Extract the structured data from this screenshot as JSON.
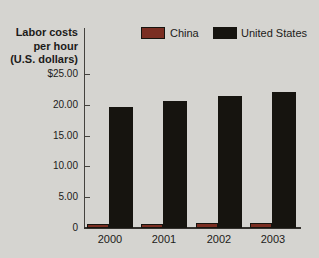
{
  "chart": {
    "y_axis_title_lines": [
      "Labor costs",
      "per hour",
      "(U.S. dollars)"
    ]
  },
  "chart_data": {
    "type": "bar",
    "title": "Labor costs per hour (U.S. dollars)",
    "xlabel": "",
    "ylabel": "Labor costs per hour (U.S. dollars)",
    "categories": [
      "2000",
      "2001",
      "2002",
      "2003"
    ],
    "series": [
      {
        "name": "China",
        "color": "#7a2e22",
        "values": [
          0.6,
          0.7,
          0.75,
          0.85
        ]
      },
      {
        "name": "United States",
        "color": "#16140f",
        "values": [
          19.7,
          20.6,
          21.5,
          22.0
        ]
      }
    ],
    "ylim": [
      0,
      25
    ],
    "y_ticks": [
      {
        "value": 25,
        "label": "$25.00"
      },
      {
        "value": 20,
        "label": "20.00"
      },
      {
        "value": 15,
        "label": "15.00"
      },
      {
        "value": 10,
        "label": "10.00"
      },
      {
        "value": 5,
        "label": "5.00"
      },
      {
        "value": 0,
        "label": "0"
      }
    ],
    "grid": false,
    "legend_position": "top"
  },
  "colors": {
    "background": "#d5d4d0",
    "axis": "#44423e",
    "text": "#1c1b19"
  }
}
